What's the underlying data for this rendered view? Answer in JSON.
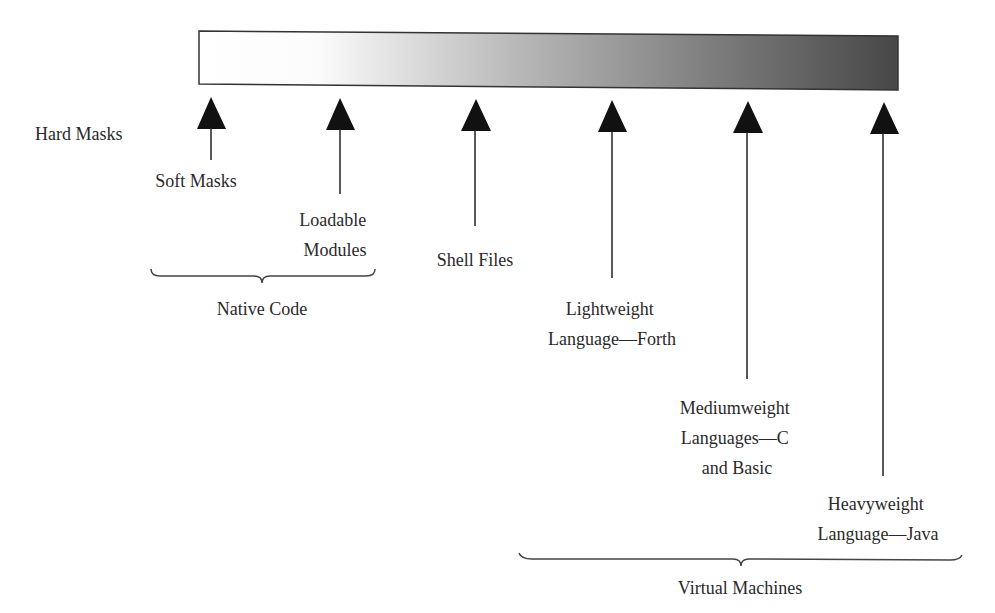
{
  "spectrum_bar": {
    "gradient_start": "#ffffff",
    "gradient_mid": "#b8b8b8",
    "gradient_end": "#4a4a4a",
    "border_color": "#333333"
  },
  "colors": {
    "arrow": "#111111",
    "text": "#2a2a2a",
    "brace": "#444444"
  },
  "markers": [
    {
      "id": "hard-masks",
      "lines": [
        "Hard Masks"
      ]
    },
    {
      "id": "soft-masks",
      "lines": [
        "Soft Masks"
      ]
    },
    {
      "id": "loadable-modules",
      "lines": [
        "Loadable",
        "Modules"
      ]
    },
    {
      "id": "shell-files",
      "lines": [
        "Shell Files"
      ]
    },
    {
      "id": "lightweight-language",
      "lines": [
        "Lightweight",
        "Language—Forth"
      ]
    },
    {
      "id": "mediumweight-languages",
      "lines": [
        "Mediumweight",
        "Languages—C",
        "and Basic"
      ]
    },
    {
      "id": "heavyweight-language",
      "lines": [
        "Heavyweight",
        "Language—Java"
      ]
    }
  ],
  "groups": [
    {
      "id": "native-code",
      "label": "Native Code"
    },
    {
      "id": "virtual-machines",
      "label": "Virtual Machines"
    }
  ]
}
